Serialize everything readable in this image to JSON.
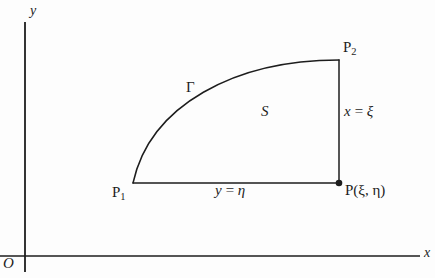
{
  "figure": {
    "kind": "math-diagram",
    "background_color": "#fdfdfd",
    "ink_color": "#1d1d1d"
  },
  "axes": {
    "x_label": "x",
    "y_label": "y",
    "origin_label": "O",
    "x_axis_y_px": 256,
    "y_axis_x_px": 25
  },
  "points": [
    {
      "id": "p1",
      "label": "P",
      "subscript": "1",
      "x_px": 133,
      "y_px": 183,
      "marker": false
    },
    {
      "id": "p2",
      "label": "P",
      "subscript": "2",
      "x_px": 339,
      "y_px": 60,
      "marker": false
    },
    {
      "id": "p",
      "label": "P(ξ, η)",
      "subscript": "",
      "x_px": 339,
      "y_px": 183,
      "marker": true
    }
  ],
  "labels": {
    "curve": "Γ",
    "region": "S",
    "vertical_edge": {
      "lhs": "x",
      "op": "=",
      "rhs": "ξ"
    },
    "horizontal_edge": {
      "lhs": "y",
      "op": "=",
      "rhs": "η"
    }
  },
  "geometry": {
    "curve_start_px": [
      133,
      183
    ],
    "curve_end_px": [
      339,
      60
    ],
    "curve_control_1_px": [
      150,
      105
    ],
    "curve_control_2_px": [
      235,
      60
    ],
    "horizontal_edge_px": [
      [
        133,
        183
      ],
      [
        339,
        183
      ]
    ],
    "vertical_edge_px": [
      [
        339,
        60
      ],
      [
        339,
        183
      ]
    ]
  }
}
